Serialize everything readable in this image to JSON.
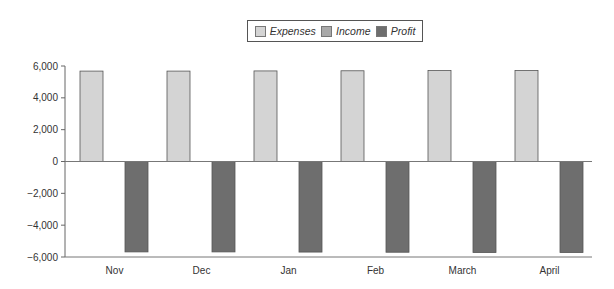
{
  "chart_data": {
    "type": "bar",
    "title": "",
    "xlabel": "",
    "ylabel": "",
    "categories": [
      "Nov",
      "Dec",
      "Jan",
      "Feb",
      "March",
      "April"
    ],
    "series": [
      {
        "name": "Expenses",
        "color": "#d4d4d4",
        "values": [
          5680,
          5680,
          5690,
          5700,
          5720,
          5720
        ]
      },
      {
        "name": "Income",
        "color": "#a9a9a9",
        "values": [
          0,
          0,
          0,
          0,
          0,
          0
        ]
      },
      {
        "name": "Profit",
        "color": "#6e6e6e",
        "values": [
          -5680,
          -5680,
          -5690,
          -5700,
          -5720,
          -5720
        ]
      }
    ],
    "ylim": [
      -6000,
      6000
    ],
    "yticks": [
      6000,
      4000,
      2000,
      0,
      -2000,
      -4000,
      -6000
    ],
    "ytick_labels": [
      "6,000",
      "4,000",
      "2,000",
      "0",
      "−2,000",
      "−4,000",
      "−6,000"
    ],
    "grid": false,
    "legend_position": "top-center"
  },
  "legend": {
    "items": [
      {
        "label": "Expenses",
        "color": "#d4d4d4"
      },
      {
        "label": "Income",
        "color": "#a9a9a9"
      },
      {
        "label": "Profit",
        "color": "#6e6e6e"
      }
    ]
  }
}
